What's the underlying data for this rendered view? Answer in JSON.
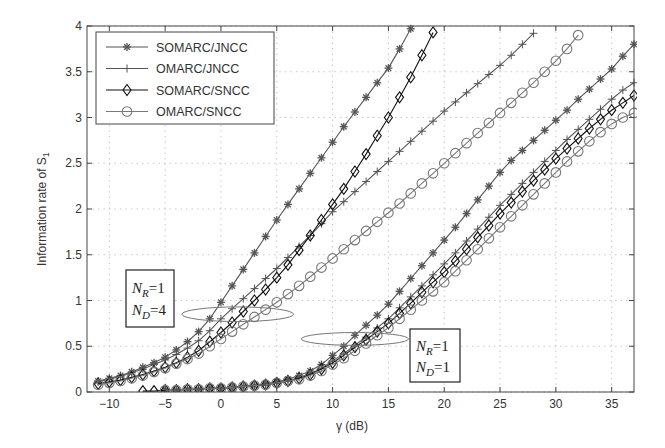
{
  "chart_data": {
    "type": "line",
    "title": "",
    "xlabel": "γ (dB)",
    "ylabel": "Information rate of S",
    "ylabel_subscript": "1",
    "xlim": [
      -12,
      37
    ],
    "ylim": [
      0,
      4
    ],
    "xticks": [
      -10,
      -5,
      0,
      5,
      10,
      15,
      20,
      25,
      30,
      35
    ],
    "yticks": [
      0,
      0.5,
      1,
      1.5,
      2,
      2.5,
      3,
      3.5,
      4
    ],
    "xtick_labels": [
      "−10",
      "−5",
      "0",
      "5",
      "10",
      "15",
      "20",
      "25",
      "30",
      "35"
    ],
    "ytick_labels": [
      "0",
      "0.5",
      "1",
      "1.5",
      "2",
      "2.5",
      "3",
      "3.5",
      "4"
    ],
    "grid": true,
    "legend_position": "upper left",
    "legend": [
      {
        "name": "SOMARC/JNCC",
        "marker": "asterisk"
      },
      {
        "name": "OMARC/JNCC",
        "marker": "plus"
      },
      {
        "name": "SOMARC/SNCC",
        "marker": "diamond"
      },
      {
        "name": "OMARC/SNCC",
        "marker": "circle"
      }
    ],
    "series": [
      {
        "name": "SOMARC/JNCC",
        "group": "N_R=1, N_D=4",
        "marker": "asterisk",
        "color": "#555555",
        "x": [
          -11,
          -10,
          -9,
          -8,
          -7,
          -6,
          -5,
          -4,
          -3,
          -2,
          -1,
          0,
          1,
          2,
          3,
          4,
          5,
          6,
          7,
          8,
          9,
          10,
          11,
          12,
          13,
          14,
          15,
          16,
          17
        ],
        "y": [
          0.12,
          0.15,
          0.18,
          0.22,
          0.27,
          0.32,
          0.38,
          0.46,
          0.55,
          0.66,
          0.8,
          0.98,
          1.16,
          1.34,
          1.52,
          1.7,
          1.88,
          2.05,
          2.22,
          2.39,
          2.56,
          2.73,
          2.9,
          3.06,
          3.22,
          3.38,
          3.54,
          3.75,
          3.97
        ]
      },
      {
        "name": "OMARC/JNCC",
        "group": "N_R=1, N_D=4",
        "marker": "plus",
        "color": "#555555",
        "x": [
          -11,
          -10,
          -9,
          -8,
          -7,
          -6,
          -5,
          -4,
          -3,
          -2,
          -1,
          0,
          1,
          2,
          3,
          4,
          5,
          6,
          7,
          8,
          9,
          10,
          11,
          12,
          13,
          14,
          15,
          16,
          17,
          18,
          19,
          20,
          21,
          22,
          23,
          24,
          25,
          26,
          27,
          28
        ],
        "y": [
          0.11,
          0.14,
          0.17,
          0.21,
          0.25,
          0.3,
          0.35,
          0.41,
          0.48,
          0.56,
          0.67,
          0.8,
          0.91,
          1.02,
          1.13,
          1.24,
          1.35,
          1.47,
          1.59,
          1.71,
          1.84,
          1.97,
          2.08,
          2.19,
          2.3,
          2.41,
          2.52,
          2.63,
          2.74,
          2.85,
          2.96,
          3.07,
          3.17,
          3.27,
          3.37,
          3.47,
          3.57,
          3.68,
          3.8,
          3.92
        ]
      },
      {
        "name": "SOMARC/SNCC",
        "group": "N_R=1, N_D=4",
        "marker": "diamond",
        "color": "#111111",
        "x": [
          -11,
          -10,
          -9,
          -8,
          -7,
          -6,
          -5,
          -4,
          -3,
          -2,
          -1,
          0,
          1,
          2,
          3,
          4,
          5,
          6,
          7,
          8,
          9,
          10,
          11,
          12,
          13,
          14,
          15,
          16,
          17,
          18,
          19
        ],
        "y": [
          0.09,
          0.11,
          0.13,
          0.16,
          0.19,
          0.23,
          0.27,
          0.32,
          0.38,
          0.45,
          0.55,
          0.65,
          0.76,
          0.88,
          1.0,
          1.12,
          1.25,
          1.39,
          1.55,
          1.71,
          1.88,
          2.05,
          2.22,
          2.41,
          2.6,
          2.8,
          3.0,
          3.22,
          3.44,
          3.68,
          3.93
        ]
      },
      {
        "name": "OMARC/SNCC",
        "group": "N_R=1, N_D=4",
        "marker": "circle",
        "color": "#777777",
        "x": [
          -11,
          -10,
          -9,
          -8,
          -7,
          -6,
          -5,
          -4,
          -3,
          -2,
          -1,
          0,
          1,
          2,
          3,
          4,
          5,
          6,
          7,
          8,
          9,
          10,
          11,
          12,
          13,
          14,
          15,
          16,
          17,
          18,
          19,
          20,
          21,
          22,
          23,
          24,
          25,
          26,
          27,
          28,
          29,
          30,
          31,
          32
        ],
        "y": [
          0.08,
          0.1,
          0.12,
          0.15,
          0.18,
          0.22,
          0.26,
          0.31,
          0.36,
          0.42,
          0.5,
          0.58,
          0.66,
          0.74,
          0.82,
          0.9,
          0.98,
          1.07,
          1.16,
          1.26,
          1.36,
          1.46,
          1.56,
          1.66,
          1.76,
          1.86,
          1.96,
          2.06,
          2.17,
          2.28,
          2.39,
          2.5,
          2.61,
          2.72,
          2.83,
          2.94,
          3.05,
          3.16,
          3.27,
          3.38,
          3.5,
          3.62,
          3.75,
          3.9
        ]
      },
      {
        "name": "SOMARC/JNCC",
        "group": "N_R=1, N_D=1",
        "marker": "asterisk",
        "color": "#555555",
        "x": [
          -5,
          -4,
          -3,
          -2,
          -1,
          0,
          1,
          2,
          3,
          4,
          5,
          6,
          7,
          8,
          9,
          10,
          11,
          12,
          13,
          14,
          15,
          16,
          17,
          18,
          19,
          20,
          21,
          22,
          23,
          24,
          25,
          26,
          27,
          28,
          29,
          30,
          31,
          32,
          33,
          34,
          35,
          36,
          37
        ],
        "y": [
          0.02,
          0.02,
          0.03,
          0.03,
          0.04,
          0.04,
          0.05,
          0.06,
          0.07,
          0.09,
          0.11,
          0.14,
          0.18,
          0.23,
          0.3,
          0.4,
          0.5,
          0.62,
          0.73,
          0.84,
          0.96,
          1.1,
          1.24,
          1.38,
          1.52,
          1.66,
          1.8,
          1.95,
          2.1,
          2.25,
          2.4,
          2.53,
          2.64,
          2.75,
          2.86,
          2.97,
          3.08,
          3.2,
          3.31,
          3.42,
          3.53,
          3.67,
          3.8
        ]
      },
      {
        "name": "OMARC/JNCC",
        "group": "N_R=1, N_D=1",
        "marker": "plus",
        "color": "#555555",
        "x": [
          -5,
          -4,
          -3,
          -2,
          -1,
          0,
          1,
          2,
          3,
          4,
          5,
          6,
          7,
          8,
          9,
          10,
          11,
          12,
          13,
          14,
          15,
          16,
          17,
          18,
          19,
          20,
          21,
          22,
          23,
          24,
          25,
          26,
          27,
          28,
          29,
          30,
          31,
          32,
          33,
          34,
          35,
          36,
          37
        ],
        "y": [
          0.02,
          0.02,
          0.03,
          0.03,
          0.04,
          0.04,
          0.05,
          0.06,
          0.07,
          0.08,
          0.1,
          0.12,
          0.16,
          0.2,
          0.26,
          0.34,
          0.42,
          0.51,
          0.6,
          0.7,
          0.8,
          0.92,
          1.04,
          1.16,
          1.28,
          1.4,
          1.52,
          1.65,
          1.78,
          1.91,
          2.04,
          2.16,
          2.28,
          2.4,
          2.52,
          2.64,
          2.76,
          2.87,
          2.98,
          3.09,
          3.2,
          3.3,
          3.38
        ]
      },
      {
        "name": "SOMARC/SNCC",
        "group": "N_R=1, N_D=1",
        "marker": "diamond",
        "color": "#111111",
        "x": [
          -7,
          -6,
          -5,
          -4,
          -3,
          -2,
          -1,
          0,
          1,
          2,
          3,
          4,
          5,
          6,
          7,
          8,
          9,
          10,
          11,
          12,
          13,
          14,
          15,
          16,
          17,
          18,
          19,
          20,
          21,
          22,
          23,
          24,
          25,
          26,
          27,
          28,
          29,
          30,
          31,
          32,
          33,
          34,
          35,
          36,
          37
        ],
        "y": [
          0.01,
          0.01,
          0.02,
          0.02,
          0.03,
          0.03,
          0.04,
          0.04,
          0.05,
          0.06,
          0.07,
          0.08,
          0.1,
          0.12,
          0.15,
          0.19,
          0.25,
          0.32,
          0.4,
          0.49,
          0.57,
          0.66,
          0.75,
          0.86,
          0.97,
          1.09,
          1.2,
          1.31,
          1.43,
          1.56,
          1.69,
          1.82,
          1.95,
          2.07,
          2.19,
          2.31,
          2.43,
          2.55,
          2.66,
          2.77,
          2.88,
          2.98,
          3.08,
          3.16,
          3.24
        ]
      },
      {
        "name": "OMARC/SNCC",
        "group": "N_R=1, N_D=1",
        "marker": "circle",
        "color": "#777777",
        "x": [
          -5,
          -4,
          -3,
          -2,
          -1,
          0,
          1,
          2,
          3,
          4,
          5,
          6,
          7,
          8,
          9,
          10,
          11,
          12,
          13,
          14,
          15,
          16,
          17,
          18,
          19,
          20,
          21,
          22,
          23,
          24,
          25,
          26,
          27,
          28,
          29,
          30,
          31,
          32,
          33,
          34,
          35,
          36,
          37
        ],
        "y": [
          0.02,
          0.02,
          0.03,
          0.03,
          0.04,
          0.04,
          0.05,
          0.06,
          0.07,
          0.08,
          0.1,
          0.12,
          0.14,
          0.18,
          0.23,
          0.3,
          0.37,
          0.45,
          0.53,
          0.62,
          0.7,
          0.8,
          0.9,
          1.0,
          1.1,
          1.2,
          1.32,
          1.44,
          1.56,
          1.68,
          1.8,
          1.92,
          2.04,
          2.16,
          2.28,
          2.4,
          2.52,
          2.63,
          2.74,
          2.84,
          2.93,
          3.0,
          3.05
        ]
      }
    ],
    "annotations": [
      {
        "type": "box",
        "lines": [
          "N_R=1",
          "N_D=4"
        ],
        "position_data": [
          -8.5,
          1.2
        ]
      },
      {
        "type": "box",
        "lines": [
          "N_R=1",
          "N_D=1"
        ],
        "position_data": [
          17.2,
          0.45
        ]
      },
      {
        "type": "ellipse",
        "center": [
          1.5,
          0.85
        ],
        "rx_dB": 5,
        "ry": 0.08,
        "group": "N_D=4"
      },
      {
        "type": "ellipse",
        "center": [
          12,
          0.58
        ],
        "rx_dB": 4.8,
        "ry": 0.07,
        "group": "N_D=1"
      }
    ]
  },
  "annotations_text": {
    "nd4": {
      "n1": "N",
      "s1": "R",
      "v1": "=1",
      "n2": "N",
      "s2": "D",
      "v2": "=4"
    },
    "nd1": {
      "n1": "N",
      "s1": "R",
      "v1": "=1",
      "n2": "N",
      "s2": "D",
      "v2": "=1"
    }
  },
  "labels": {
    "xlabel": "γ (dB)",
    "ylabel": "Information rate of S",
    "ylabel_sub": "1"
  }
}
